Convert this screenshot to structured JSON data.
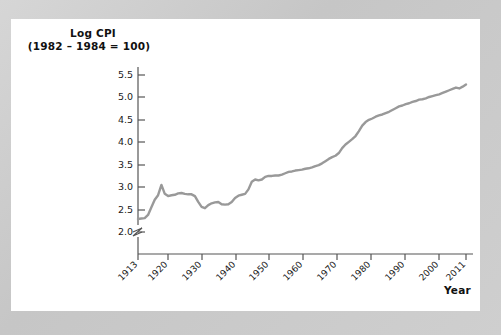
{
  "figure": {
    "frame_color": "#c9c9c9",
    "panel_color": "#ffffff",
    "line_color": "#999999",
    "axis_color": "#555555",
    "text_color": "#1a1a1a"
  },
  "labels": {
    "ylabel_line1": "Log CPI",
    "ylabel_line2": "(1982 – 1984 = 100)",
    "xlabel": "Year"
  },
  "chart_data": {
    "type": "line",
    "xlabel": "Year",
    "ylabel": "Log CPI (1982 – 1984 = 100)",
    "xlim": [
      1913,
      2011
    ],
    "ylim": [
      1.85,
      5.75
    ],
    "grid": false,
    "legend": null,
    "axis_break_y": true,
    "axis_break_below": 2.0,
    "ytick_labels": [
      "2.0",
      "2.5",
      "3.0",
      "3.5",
      "4.0",
      "4.5",
      "5.0",
      "5.5"
    ],
    "ytick_values": [
      2.0,
      2.5,
      3.0,
      3.5,
      4.0,
      4.5,
      5.0,
      5.5
    ],
    "xtick_labels": [
      "1913",
      "1920",
      "1930",
      "1940",
      "1950",
      "1960",
      "1970",
      "1980",
      "1990",
      "2000",
      "2011"
    ],
    "xtick_values": [
      1913,
      1920,
      1930,
      1940,
      1950,
      1960,
      1970,
      1980,
      1990,
      2000,
      2011
    ],
    "series": [
      {
        "name": "Log CPI",
        "x": [
          1913,
          1914,
          1915,
          1916,
          1917,
          1918,
          1919,
          1920,
          1921,
          1922,
          1923,
          1924,
          1925,
          1926,
          1927,
          1928,
          1929,
          1930,
          1931,
          1932,
          1933,
          1934,
          1935,
          1936,
          1937,
          1938,
          1939,
          1940,
          1941,
          1942,
          1943,
          1944,
          1945,
          1946,
          1947,
          1948,
          1949,
          1950,
          1951,
          1952,
          1953,
          1954,
          1955,
          1956,
          1957,
          1958,
          1959,
          1960,
          1961,
          1962,
          1963,
          1964,
          1965,
          1966,
          1967,
          1968,
          1969,
          1970,
          1971,
          1972,
          1973,
          1974,
          1975,
          1976,
          1977,
          1978,
          1979,
          1980,
          1981,
          1982,
          1983,
          1984,
          1985,
          1986,
          1987,
          1988,
          1989,
          1990,
          1991,
          1992,
          1993,
          1994,
          1995,
          1996,
          1997,
          1998,
          1999,
          2000,
          2001,
          2002,
          2003,
          2004,
          2005,
          2006,
          2007,
          2008,
          2009,
          2010,
          2011
        ],
        "y": [
          2.29,
          2.3,
          2.31,
          2.38,
          2.55,
          2.72,
          2.82,
          3.05,
          2.85,
          2.8,
          2.82,
          2.83,
          2.86,
          2.87,
          2.85,
          2.84,
          2.84,
          2.8,
          2.67,
          2.56,
          2.53,
          2.6,
          2.64,
          2.66,
          2.67,
          2.62,
          2.61,
          2.62,
          2.67,
          2.76,
          2.81,
          2.83,
          2.85,
          2.95,
          3.12,
          3.17,
          3.15,
          3.17,
          3.23,
          3.25,
          3.25,
          3.26,
          3.26,
          3.28,
          3.31,
          3.34,
          3.35,
          3.37,
          3.38,
          3.39,
          3.41,
          3.42,
          3.44,
          3.47,
          3.49,
          3.53,
          3.58,
          3.63,
          3.67,
          3.7,
          3.76,
          3.87,
          3.95,
          4.01,
          4.07,
          4.14,
          4.25,
          4.37,
          4.45,
          4.5,
          4.53,
          4.57,
          4.6,
          4.62,
          4.65,
          4.68,
          4.72,
          4.76,
          4.8,
          4.82,
          4.85,
          4.87,
          4.9,
          4.92,
          4.95,
          4.96,
          4.98,
          5.01,
          5.03,
          5.05,
          5.07,
          5.1,
          5.13,
          5.16,
          5.19,
          5.22,
          5.2,
          5.24,
          5.29
        ]
      }
    ],
    "annotations": [
      "Continuous upward trend in US Consumer Price Index (log scale) from 1913 to 2011",
      "Post-WWI spike peaking circa 1920",
      "Deflation trough during the Great Depression circa 1933",
      "Steep acceleration through the 1970s inflation",
      "Slight decline during 2009"
    ]
  }
}
